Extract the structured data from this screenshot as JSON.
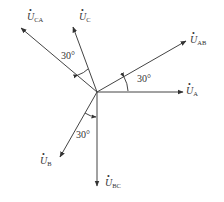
{
  "diagram": {
    "type": "phasor-diagram",
    "origin": [
      97,
      92
    ],
    "stroke_color": "#444444",
    "phasors": [
      {
        "id": "UA",
        "symbol": "U",
        "subscript": "A",
        "tip": [
          184,
          92
        ],
        "label_pos": [
          186,
          86
        ]
      },
      {
        "id": "UAB",
        "symbol": "U",
        "subscript": "AB",
        "tip": [
          187,
          41
        ],
        "label_pos": [
          190,
          35
        ]
      },
      {
        "id": "UC",
        "symbol": "U",
        "subscript": "C",
        "tip": [
          73,
          26
        ],
        "label_pos": [
          79,
          12
        ]
      },
      {
        "id": "UCA",
        "symbol": "U",
        "subscript": "CA",
        "tip": [
          21,
          28
        ],
        "label_pos": [
          27,
          12
        ]
      },
      {
        "id": "UB",
        "symbol": "U",
        "subscript": "B",
        "tip": [
          60,
          157
        ],
        "label_pos": [
          40,
          156
        ]
      },
      {
        "id": "UBC",
        "symbol": "U",
        "subscript": "BC",
        "tip": [
          97,
          186
        ],
        "label_pos": [
          105,
          178
        ]
      }
    ],
    "angle_labels": [
      {
        "text": "30°",
        "pos": [
          137,
          74
        ],
        "between": [
          "UA",
          "UAB"
        ]
      },
      {
        "text": "30°",
        "pos": [
          61,
          51
        ],
        "between": [
          "UCA",
          "UC"
        ]
      },
      {
        "text": "30°",
        "pos": [
          76,
          130
        ],
        "between": [
          "UB",
          "UBC"
        ]
      }
    ]
  }
}
